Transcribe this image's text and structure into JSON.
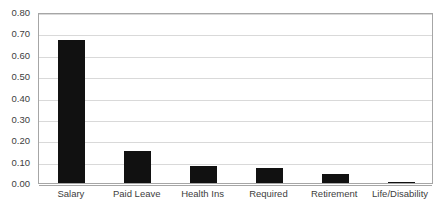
{
  "chart_data": {
    "type": "bar",
    "title": "",
    "xlabel": "",
    "ylabel": "",
    "ylim": [
      0.0,
      0.8
    ],
    "ytick_step": 0.1,
    "grid": true,
    "legend": false,
    "bar_color": "#111111",
    "gridline_color": "#d9d9d9",
    "axis_color": "#a6a6a6",
    "background_color": "#ffffff",
    "categories": [
      "Salary",
      "Paid Leave",
      "Health Ins",
      "Required",
      "Retirement",
      "Life/Disability"
    ],
    "values": [
      0.67,
      0.15,
      0.08,
      0.07,
      0.04,
      0.005
    ],
    "ytick_labels": [
      "0.80",
      "0.70",
      "0.60",
      "0.50",
      "0.40",
      "0.30",
      "0.20",
      "0.10",
      "0.00"
    ],
    "ytick_values": [
      0.8,
      0.7,
      0.6,
      0.5,
      0.4,
      0.3,
      0.2,
      0.1,
      0.0
    ]
  }
}
